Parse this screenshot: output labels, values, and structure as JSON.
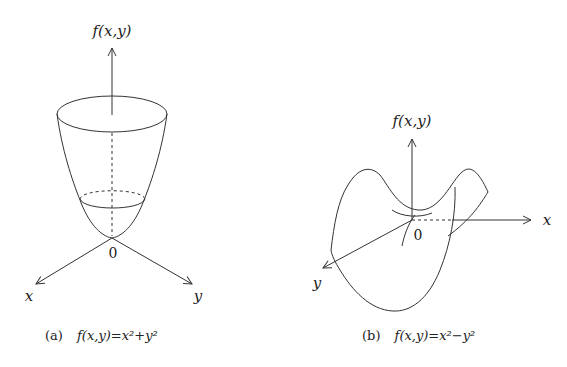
{
  "figure_a": {
    "axis_vertical_label": "f(x,y)",
    "axis_x_label": "x",
    "axis_y_label": "y",
    "origin_label": "0",
    "caption_tag": "(a)",
    "caption_formula": "f(x,y)=x²+y²",
    "surface": "paraboloid"
  },
  "figure_b": {
    "axis_vertical_label": "f(x,y)",
    "axis_x_label": "x",
    "axis_y_label": "y",
    "origin_label": "0",
    "caption_tag": "(b)",
    "caption_formula": "f(x,y)=x²−y²",
    "surface": "saddle"
  },
  "colors": {
    "line": "#333333",
    "text": "#222222",
    "background": "#ffffff"
  }
}
